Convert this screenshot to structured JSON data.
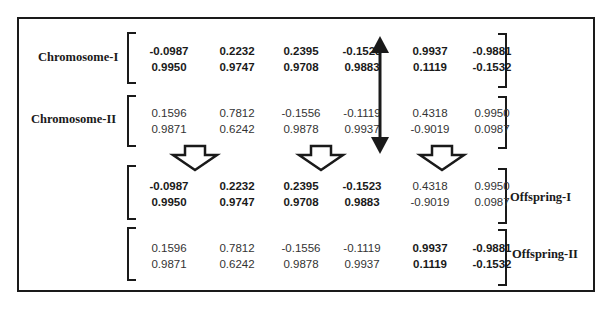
{
  "labels": {
    "chromosome_1": "Chromosome-I",
    "chromosome_2": "Chromosome-II",
    "offspring_1": "Offspring-I",
    "offspring_2": "Offspring-II"
  },
  "chromosome_1": {
    "genes": [
      {
        "top": "-0.0987",
        "bottom": "0.9950",
        "bold": true
      },
      {
        "top": "0.2232",
        "bottom": "0.9747",
        "bold": true
      },
      {
        "top": "0.2395",
        "bottom": "0.9708",
        "bold": true
      },
      {
        "top": "-0.1523",
        "bottom": "0.9883",
        "bold": true
      },
      {
        "top": "0.9937",
        "bottom": "0.1119",
        "bold": true
      },
      {
        "top": "-0.9881",
        "bottom": "-0.1532",
        "bold": true
      }
    ]
  },
  "chromosome_2": {
    "genes": [
      {
        "top": "0.1596",
        "bottom": "0.9871",
        "bold": false
      },
      {
        "top": "0.7812",
        "bottom": "0.6242",
        "bold": false
      },
      {
        "top": "-0.1556",
        "bottom": "0.9878",
        "bold": false
      },
      {
        "top": "-0.1119",
        "bottom": "0.9937",
        "bold": false
      },
      {
        "top": "0.4318",
        "bottom": "-0.9019",
        "bold": false
      },
      {
        "top": "0.9950",
        "bottom": "0.0987",
        "bold": false
      }
    ]
  },
  "offspring_1": {
    "genes": [
      {
        "top": "-0.0987",
        "bottom": "0.9950",
        "bold": true
      },
      {
        "top": "0.2232",
        "bottom": "0.9747",
        "bold": true
      },
      {
        "top": "0.2395",
        "bottom": "0.9708",
        "bold": true
      },
      {
        "top": "-0.1523",
        "bottom": "0.9883",
        "bold": true
      },
      {
        "top": "0.4318",
        "bottom": "-0.9019",
        "bold": false
      },
      {
        "top": "0.9950",
        "bottom": "0.0987",
        "bold": false
      }
    ]
  },
  "offspring_2": {
    "genes": [
      {
        "top": "0.1596",
        "bottom": "0.9871",
        "bold": false
      },
      {
        "top": "0.7812",
        "bottom": "0.6242",
        "bold": false
      },
      {
        "top": "-0.1556",
        "bottom": "0.9878",
        "bold": false
      },
      {
        "top": "-0.1119",
        "bottom": "0.9937",
        "bold": false
      },
      {
        "top": "0.9937",
        "bottom": "0.1119",
        "bold": true
      },
      {
        "top": "-0.9881",
        "bottom": "-0.1532",
        "bold": true
      }
    ]
  },
  "icons": {
    "crossover_point": "double-headed-vertical-arrow",
    "transition": "hollow-down-arrow"
  },
  "colors": {
    "ink": "#1a1a1a",
    "text": "#333333",
    "background": "#ffffff"
  }
}
